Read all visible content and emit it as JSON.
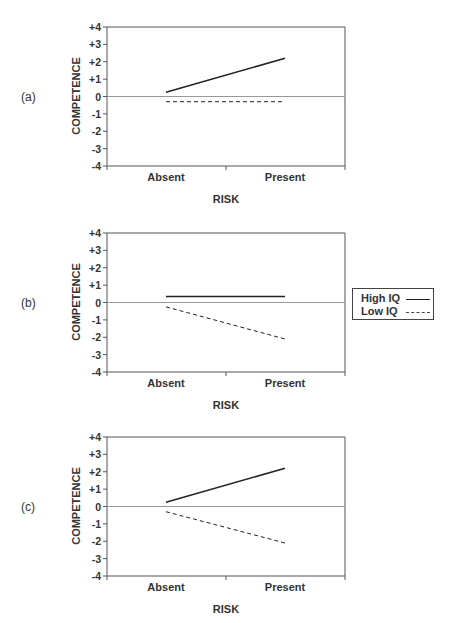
{
  "legend": {
    "items": [
      {
        "label": "High IQ",
        "style": "solid"
      },
      {
        "label": "Low IQ",
        "style": "dashed"
      }
    ]
  },
  "panels": [
    {
      "label": "(a)",
      "ylabel": "COMPETENCE",
      "xlabel": "RISK",
      "yticks": [
        "+4",
        "+3",
        "+2",
        "+1",
        "0",
        "-1",
        "-2",
        "-3",
        "-4"
      ],
      "categories": [
        "Absent",
        "Present"
      ]
    },
    {
      "label": "(b)",
      "ylabel": "COMPETENCE",
      "xlabel": "RISK",
      "yticks": [
        "+4",
        "+3",
        "+2",
        "+1",
        "0",
        "-1",
        "-2",
        "-3",
        "-4"
      ],
      "categories": [
        "Absent",
        "Present"
      ]
    },
    {
      "label": "(c)",
      "ylabel": "COMPETENCE",
      "xlabel": "RISK",
      "yticks": [
        "+4",
        "+3",
        "+2",
        "+1",
        "0",
        "-1",
        "-2",
        "-3",
        "-4"
      ],
      "categories": [
        "Absent",
        "Present"
      ]
    }
  ],
  "colors": {
    "line": "#222222",
    "axis": "#555555",
    "zero_line": "#999999"
  },
  "chart_data": [
    {
      "type": "line",
      "title": "(a)",
      "xlabel": "RISK",
      "ylabel": "COMPETENCE",
      "categories": [
        "Absent",
        "Present"
      ],
      "ylim": [
        -4,
        4
      ],
      "yticks": [
        4,
        3,
        2,
        1,
        0,
        -1,
        -2,
        -3,
        -4
      ],
      "grid": false,
      "zero_line": true,
      "series": [
        {
          "name": "High IQ",
          "style": "solid",
          "values": [
            0.25,
            2.2
          ]
        },
        {
          "name": "Low IQ",
          "style": "dashed",
          "values": [
            -0.3,
            -0.3
          ]
        }
      ]
    },
    {
      "type": "line",
      "title": "(b)",
      "xlabel": "RISK",
      "ylabel": "COMPETENCE",
      "categories": [
        "Absent",
        "Present"
      ],
      "ylim": [
        -4,
        4
      ],
      "yticks": [
        4,
        3,
        2,
        1,
        0,
        -1,
        -2,
        -3,
        -4
      ],
      "grid": false,
      "zero_line": true,
      "legend_position": "right",
      "series": [
        {
          "name": "High IQ",
          "style": "solid",
          "values": [
            0.35,
            0.35
          ]
        },
        {
          "name": "Low IQ",
          "style": "dashed",
          "values": [
            -0.25,
            -2.1
          ]
        }
      ]
    },
    {
      "type": "line",
      "title": "(c)",
      "xlabel": "RISK",
      "ylabel": "COMPETENCE",
      "categories": [
        "Absent",
        "Present"
      ],
      "ylim": [
        -4,
        4
      ],
      "yticks": [
        4,
        3,
        2,
        1,
        0,
        -1,
        -2,
        -3,
        -4
      ],
      "grid": false,
      "zero_line": true,
      "series": [
        {
          "name": "High IQ",
          "style": "solid",
          "values": [
            0.25,
            2.2
          ]
        },
        {
          "name": "Low IQ",
          "style": "dashed",
          "values": [
            -0.3,
            -2.1
          ]
        }
      ]
    }
  ]
}
